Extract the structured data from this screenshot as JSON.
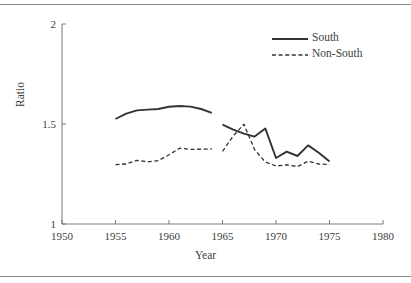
{
  "chart_data": {
    "type": "line",
    "title": "",
    "xlabel": "Year",
    "ylabel": "Ratio",
    "xlim": [
      1950,
      1980
    ],
    "ylim": [
      1,
      2
    ],
    "xticks": [
      1950,
      1955,
      1960,
      1965,
      1970,
      1975,
      1980
    ],
    "xtick_labels": [
      "1950",
      "1955",
      "1960",
      "1965",
      "1970",
      "1975",
      "1980"
    ],
    "yticks": [
      1,
      1.5,
      2
    ],
    "ytick_labels": [
      "1",
      "1.5",
      "2"
    ],
    "grid": false,
    "legend_position": "top-right",
    "series": [
      {
        "name": "South",
        "style": "solid",
        "color": "#333333",
        "segments": [
          {
            "x": [
              1955,
              1956,
              1957,
              1958,
              1959,
              1960,
              1961,
              1962,
              1963,
              1964
            ],
            "y": [
              1.525,
              1.552,
              1.568,
              1.572,
              1.575,
              1.586,
              1.59,
              1.587,
              1.575,
              1.556
            ]
          },
          {
            "x": [
              1965,
              1966,
              1967,
              1968,
              1969,
              1970,
              1971,
              1972,
              1973,
              1974,
              1975
            ],
            "y": [
              1.497,
              1.472,
              1.452,
              1.437,
              1.478,
              1.33,
              1.362,
              1.34,
              1.393,
              1.356,
              1.312
            ]
          }
        ]
      },
      {
        "name": "Non-South",
        "style": "dashed",
        "color": "#333333",
        "segments": [
          {
            "x": [
              1955,
              1956,
              1957,
              1958,
              1959,
              1960,
              1961,
              1962,
              1963,
              1964
            ],
            "y": [
              1.297,
              1.3,
              1.318,
              1.311,
              1.317,
              1.346,
              1.379,
              1.373,
              1.374,
              1.375
            ]
          },
          {
            "x": [
              1965,
              1966,
              1967,
              1968,
              1969,
              1970,
              1971,
              1972,
              1973,
              1974,
              1975
            ],
            "y": [
              1.363,
              1.44,
              1.499,
              1.372,
              1.31,
              1.29,
              1.296,
              1.287,
              1.314,
              1.3,
              1.298
            ]
          }
        ]
      }
    ]
  },
  "legend": {
    "entries": [
      {
        "label": "South",
        "style": "solid"
      },
      {
        "label": "Non-South",
        "style": "dashed"
      }
    ]
  },
  "axes": {
    "y_title": "Ratio",
    "x_title": "Year",
    "x_tick_labels": [
      "1950",
      "1955",
      "1960",
      "1965",
      "1970",
      "1975",
      "1980"
    ],
    "y_tick_labels": [
      "2",
      "1.5",
      "1"
    ]
  },
  "colors": {
    "line": "#333333",
    "axis": "#808080",
    "text": "#3d3d3d",
    "rule": "#8a8a8a",
    "background": "#ffffff"
  }
}
